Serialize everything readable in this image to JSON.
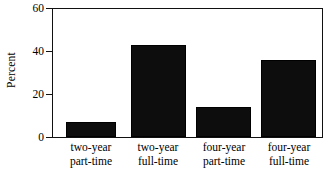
{
  "chart_data": {
    "type": "bar",
    "title": "",
    "subtitle": "",
    "xlabel": "",
    "ylabel": "Percent",
    "categories": [
      "two-year part-time",
      "two-year full-time",
      "four-year part-time",
      "four-year full-time"
    ],
    "category_lines": [
      [
        "two-year",
        "part-time"
      ],
      [
        "two-year",
        "full-time"
      ],
      [
        "four-year",
        "part-time"
      ],
      [
        "four-year",
        "full-time"
      ]
    ],
    "values": [
      7,
      43,
      14,
      36
    ],
    "ylim": [
      0,
      60
    ],
    "yticks": [
      0,
      20,
      40,
      60
    ],
    "ytick_labels": [
      "0",
      "20",
      "40",
      "60"
    ],
    "grid": false,
    "legend": null,
    "bar_color": "#0d0d0d",
    "axis_color": "#111111",
    "background": "#ffffff"
  }
}
